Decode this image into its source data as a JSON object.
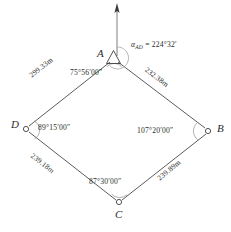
{
  "diagram": {
    "type": "closed-traverse-quadrilateral",
    "north_arrow": {
      "name": "north-arrow",
      "from_point": "A",
      "direction": "up"
    },
    "stations": [
      {
        "id": "A",
        "label": "A",
        "marker": "triangle",
        "x": 113,
        "y": 58,
        "label_x": 98,
        "label_y": 49
      },
      {
        "id": "B",
        "label": "B",
        "marker": "circle",
        "x": 208,
        "y": 131,
        "label_x": 218,
        "label_y": 124
      },
      {
        "id": "C",
        "label": "C",
        "marker": "circle",
        "x": 119,
        "y": 203,
        "label_x": 114,
        "label_y": 209
      },
      {
        "id": "D",
        "label": "D",
        "marker": "circle",
        "x": 26,
        "y": 128,
        "label_x": 12,
        "label_y": 120
      }
    ],
    "sides": [
      {
        "from": "A",
        "to": "D",
        "length": "299.33m",
        "label_x": 32,
        "label_y": 77,
        "rotation": -38
      },
      {
        "from": "A",
        "to": "B",
        "length": "232.38m",
        "label_x": 152,
        "label_y": 70,
        "rotation": 37
      },
      {
        "from": "D",
        "to": "C",
        "length": "239.18m",
        "label_x": 37,
        "label_y": 157,
        "rotation": 38
      },
      {
        "from": "C",
        "to": "B",
        "length": "239.89m",
        "label_x": 160,
        "label_y": 160,
        "rotation": -39
      }
    ],
    "interior_angles": [
      {
        "at": "A",
        "value": "75°56′00″",
        "label_x": 72,
        "label_y": 72
      },
      {
        "at": "B",
        "value": "107°20′00″",
        "label_x": 139,
        "label_y": 125
      },
      {
        "at": "C",
        "value": "87°30′00″",
        "label_x": 91,
        "label_y": 178
      },
      {
        "at": "D",
        "value": "89°15′00″",
        "label_x": 37,
        "label_y": 122
      }
    ],
    "azimuth": {
      "symbol": "α",
      "subscript": "AD",
      "equals": "=",
      "value": "224°32′",
      "full_text": "αAD = 224°32′",
      "label_x": 132,
      "label_y": 43
    },
    "colors": {
      "line": "#4a4a4a",
      "arc": "#8a8a8a",
      "text": "#2b2b2b",
      "background": "#ffffff"
    }
  }
}
